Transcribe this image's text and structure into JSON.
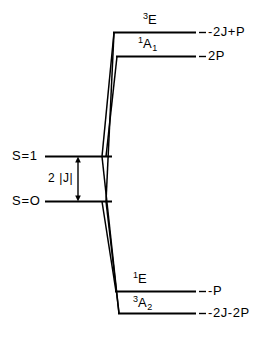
{
  "figure": {
    "kind": "energy-level-correlation-diagram",
    "background_color": "#ffffff",
    "line_color": "#000000"
  },
  "left_levels": [
    {
      "id": "s1",
      "label": "S=1"
    },
    {
      "id": "s0",
      "label": "S=O"
    }
  ],
  "gap_annotation": {
    "label": "2 |J|",
    "arrow": "double-headed-vertical"
  },
  "right_levels": [
    {
      "id": "triplet-e",
      "term_superscript": "3",
      "term_letter": "E",
      "term_subscript": "",
      "energy": "-2J+P"
    },
    {
      "id": "singlet-a1",
      "term_superscript": "1",
      "term_letter": "A",
      "term_subscript": "1",
      "energy": "2P"
    },
    {
      "id": "singlet-e",
      "term_superscript": "1",
      "term_letter": "E",
      "term_subscript": "",
      "energy": "-P"
    },
    {
      "id": "triplet-a2",
      "term_superscript": "3",
      "term_letter": "A",
      "term_subscript": "2",
      "energy": "-2J-2P"
    }
  ]
}
